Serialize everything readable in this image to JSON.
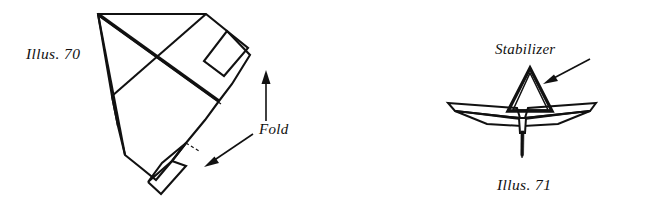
{
  "page": {
    "background_color": "#ffffff",
    "ink_color": "#111111",
    "width": 654,
    "height": 204
  },
  "figures": [
    {
      "id": "illus-70",
      "caption": "Illus. 70",
      "subject": "folded paper airplane sheet, flat pattern with two fold flaps",
      "callouts": [
        {
          "id": "fold",
          "label": "Fold",
          "arrow_count": 2
        }
      ]
    },
    {
      "id": "illus-71",
      "caption": "Illus. 71",
      "subject": "front view of finished paper airplane with vertical fin",
      "callouts": [
        {
          "id": "stabilizer",
          "label": "Stabilizer",
          "arrow_count": 1
        }
      ]
    }
  ],
  "labels": {
    "illus_70": "Illus. 70",
    "fold": "Fold",
    "stabilizer": "Stabilizer",
    "illus_71": "Illus. 71"
  },
  "icons": {
    "fold_arrow_up": "arrow-up-icon",
    "fold_arrow_down_left": "arrow-down-left-icon",
    "stabilizer_arrow": "arrow-down-left-icon"
  }
}
